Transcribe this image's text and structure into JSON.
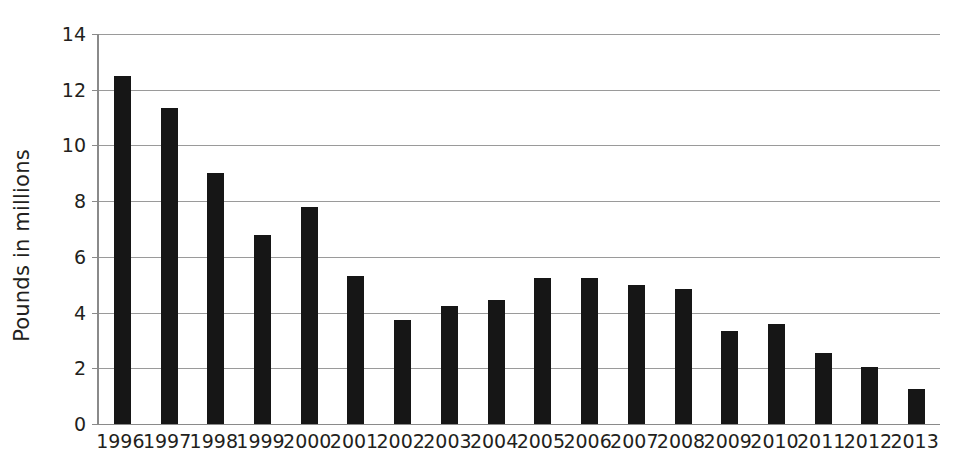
{
  "chart_data": {
    "type": "bar",
    "title": "",
    "xlabel": "",
    "ylabel": "Pounds in millions",
    "categories": [
      "1996",
      "1997",
      "1998",
      "1999",
      "2000",
      "2001",
      "2002",
      "2003",
      "2004",
      "2005",
      "2006",
      "2007",
      "2008",
      "2009",
      "2010",
      "2011",
      "2012",
      "2013"
    ],
    "values": [
      12.5,
      11.35,
      9.0,
      6.8,
      7.8,
      5.3,
      3.75,
      4.25,
      4.45,
      5.25,
      5.25,
      5.0,
      4.85,
      3.35,
      3.6,
      2.55,
      2.05,
      1.25
    ],
    "ylim": [
      0,
      14
    ],
    "ytick_values": [
      0,
      2,
      4,
      6,
      8,
      10,
      12,
      14
    ],
    "ytick_labels": [
      "0",
      "2",
      "4",
      "6",
      "8",
      "10",
      "12",
      "14"
    ],
    "grid": "horizontal",
    "legend": "none",
    "series_color": "#161616",
    "gridline_color": "#9a9a9a",
    "axis_color": "#8a8a8a",
    "background": "#ffffff"
  }
}
